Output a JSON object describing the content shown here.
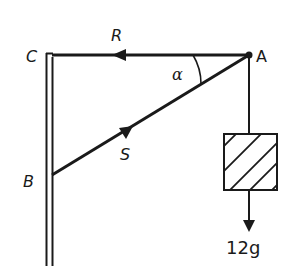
{
  "diagram": {
    "type": "statics-force-diagram",
    "points": {
      "A": {
        "label": "A",
        "x": 249,
        "y": 55
      },
      "B": {
        "label": "B",
        "x": 52,
        "y": 175
      },
      "C": {
        "label": "C",
        "x": 52,
        "y": 55
      }
    },
    "members": [
      {
        "name": "tie-CA",
        "from": "A",
        "to": "C",
        "force_label": "R",
        "arrow_direction": "toward C"
      },
      {
        "name": "strut-BA",
        "from": "B",
        "to": "A",
        "force_label": "S",
        "arrow_direction": "toward A"
      }
    ],
    "angle": {
      "label": "α",
      "at": "A",
      "between": [
        "AC",
        "AB"
      ]
    },
    "load": {
      "label": "12g",
      "hanging_from": "A",
      "direction": "down"
    },
    "wall": {
      "side": "left",
      "style": "double-line"
    },
    "colors": {
      "ink": "#1a1a1a",
      "background": "#ffffff"
    }
  }
}
